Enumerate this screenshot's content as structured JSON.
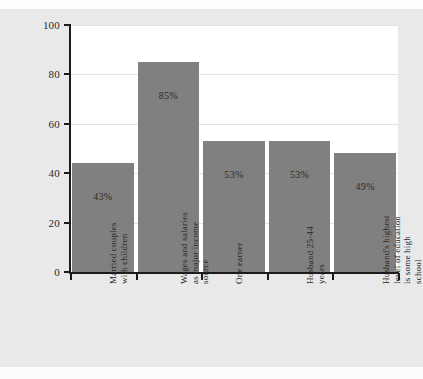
{
  "page": {
    "background_color": "#e9e9e9",
    "plot_background_color": "#ffffff"
  },
  "chart_data": {
    "type": "bar",
    "title": "",
    "subtitle": "",
    "xlabel": "",
    "ylabel": "",
    "ylim": [
      0,
      100
    ],
    "yticks": [
      0,
      20,
      40,
      60,
      80,
      100
    ],
    "ytick_labels": [
      "0",
      "20",
      "40",
      "60",
      "80",
      "100"
    ],
    "grid": true,
    "grid_axis": "y",
    "legend": false,
    "legend_position": "none",
    "bar_color": "#808080",
    "categories": [
      "Married couples with children",
      "Wages and salaries as major income source",
      "One earner",
      "Husband 25-44 years",
      "Husband's highest level of education is some high school"
    ],
    "category_lines": [
      [
        "Married couples",
        "with children"
      ],
      [
        "Wages and salaries",
        "as major income",
        "source"
      ],
      [
        "One earner"
      ],
      [
        "Husband 25-44",
        "years"
      ],
      [
        "Husband's highest",
        "level of education",
        "is some high",
        "school"
      ]
    ],
    "values": [
      44,
      85,
      53,
      53,
      48
    ],
    "data_labels": [
      "43%",
      "85%",
      "53%",
      "53%",
      "49%"
    ]
  }
}
